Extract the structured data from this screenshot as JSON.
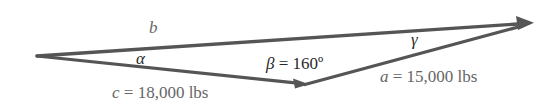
{
  "diagram": {
    "type": "vector-triangle",
    "colors": {
      "line": "#555555",
      "label_dark": "#2a2a2a",
      "label_gray": "#666666",
      "background": "#ffffff"
    },
    "vertices": {
      "left": [
        37,
        56
      ],
      "bottom": [
        307,
        84
      ],
      "right": [
        532,
        23
      ]
    },
    "sides": {
      "b": {
        "symbol": "b"
      },
      "c": {
        "symbol": "c",
        "eq": " = 18,000 lbs"
      },
      "a": {
        "symbol": "a",
        "eq": " = 15,000 lbs"
      }
    },
    "angles": {
      "alpha": {
        "symbol": "α"
      },
      "beta": {
        "symbol": "β",
        "eq": " = 160º"
      },
      "gamma": {
        "symbol": "γ"
      }
    }
  }
}
